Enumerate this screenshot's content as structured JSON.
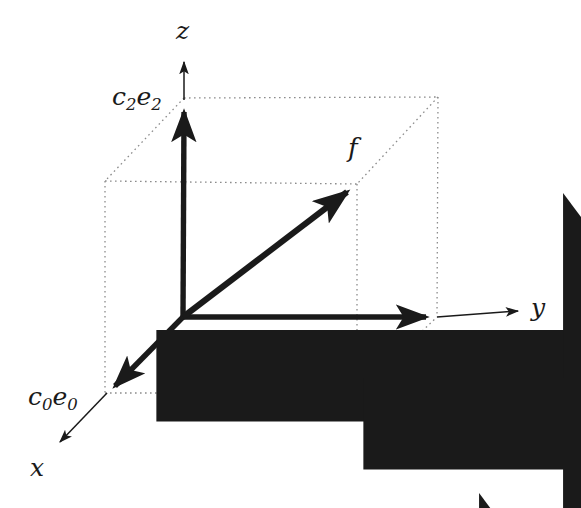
{
  "figure": {
    "background_color": "#ffffff",
    "ink_color": "#1a1a1a",
    "dotted_color": "#8c8c8c",
    "width": 581,
    "height": 508
  },
  "axes": [
    {
      "id": "x",
      "label": "x",
      "label_x": 30,
      "label_y": 455,
      "tip_x": 57,
      "tip_y": 445
    },
    {
      "id": "y",
      "label": "y",
      "label_x": 531,
      "label_y": 295,
      "tip_x": 522,
      "tip_y": 310
    },
    {
      "id": "z",
      "label": "z",
      "label_x": 176,
      "label_y": 18,
      "tip_x": 184,
      "tip_y": 60
    }
  ],
  "components": [
    {
      "id": "c0e0",
      "coefficient": "c",
      "coefficient_sub": "0",
      "basis": "e",
      "basis_sub": "0",
      "label_x": 28,
      "label_y": 382,
      "tip_x": 107,
      "tip_y": 393
    },
    {
      "id": "c1e1",
      "coefficient": "c",
      "coefficient_sub": "1",
      "basis": "e",
      "basis_sub": "1",
      "label_x": 415,
      "label_y": 326,
      "tip_x": 437,
      "tip_y": 317
    },
    {
      "id": "c2e2",
      "coefficient": "c",
      "coefficient_sub": "2",
      "basis": "e",
      "basis_sub": "2",
      "label_x": 112,
      "label_y": 82,
      "tip_x": 184,
      "tip_y": 100
    }
  ],
  "vector": {
    "id": "f",
    "label": "f",
    "label_x": 348,
    "label_y": 133,
    "origin_x": 183,
    "origin_y": 317,
    "tip_x": 357,
    "tip_y": 184
  },
  "origin": {
    "x": 183,
    "y": 317
  },
  "cube": {
    "front_top_left": {
      "x": 105,
      "y": 181
    },
    "front_top_right": {
      "x": 357,
      "y": 184
    },
    "front_bottom_left": {
      "x": 105,
      "y": 393
    },
    "front_bottom_right": {
      "x": 357,
      "y": 393
    },
    "back_top_left": {
      "x": 184,
      "y": 98
    },
    "back_top_right": {
      "x": 438,
      "y": 97
    },
    "back_bottom_left": {
      "x": 183,
      "y": 317
    },
    "back_bottom_right": {
      "x": 437,
      "y": 317
    }
  }
}
